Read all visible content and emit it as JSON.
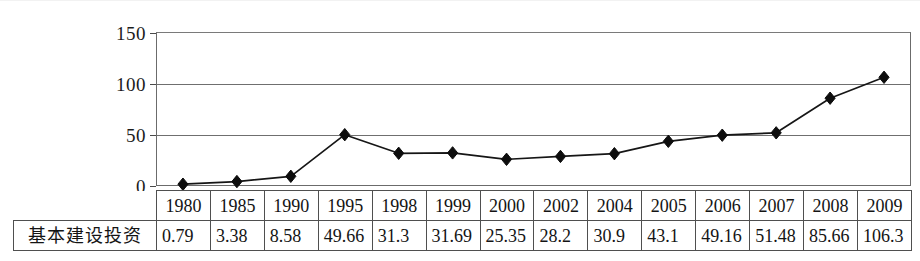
{
  "chart_data": {
    "type": "line",
    "title": "",
    "xlabel": "",
    "ylabel": "",
    "ylim": [
      0,
      150
    ],
    "yticks": [
      0,
      50,
      100,
      150
    ],
    "grid": true,
    "legend": false,
    "marker": "diamond",
    "series_name": "基本建设投资",
    "categories": [
      "1980",
      "1985",
      "1990",
      "1995",
      "1998",
      "1999",
      "2000",
      "2002",
      "2004",
      "2005",
      "2006",
      "2007",
      "2008",
      "2009"
    ],
    "values": [
      0.79,
      3.38,
      8.58,
      49.66,
      31.3,
      31.69,
      25.35,
      28.2,
      30.9,
      43.1,
      49.16,
      51.48,
      85.66,
      106.3
    ],
    "value_labels": [
      "0.79",
      "3.38",
      "8.58",
      "49.66",
      "31.3",
      "31.69",
      "25.35",
      "28.2",
      "30.9",
      "43.1",
      "49.16",
      "51.48",
      "85.66",
      "106.3"
    ]
  },
  "table": {
    "row_label": "基本建设投资",
    "years": [
      "1980",
      "1985",
      "1990",
      "1995",
      "1998",
      "1999",
      "2000",
      "2002",
      "2004",
      "2005",
      "2006",
      "2007",
      "2008",
      "2009"
    ],
    "values": [
      "0.79",
      "3.38",
      "8.58",
      "49.66",
      "31.3",
      "31.69",
      "25.35",
      "28.2",
      "30.9",
      "43.1",
      "49.16",
      "51.48",
      "85.66",
      "106.3"
    ]
  },
  "axis": {
    "y_labels": [
      "150",
      "100",
      "50",
      "0"
    ]
  },
  "colors": {
    "line": "#161616",
    "marker": "#0d0d0d",
    "grid": "#6f6f6f",
    "border": "#6b6b6b",
    "text": "#141414",
    "background": "#ffffff"
  }
}
